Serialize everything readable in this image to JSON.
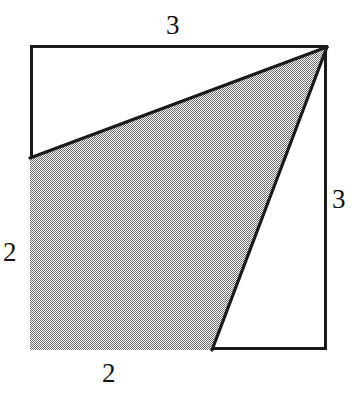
{
  "figure": {
    "kind": "geometry-diagram",
    "background_color": "#ffffff",
    "outline_color": "#1a1a1a",
    "fill_color": "#a9a9a9",
    "fill_pattern": "halftone-dither-50",
    "square": {
      "left": 30,
      "top": 45,
      "right": 327,
      "bottom": 350,
      "stroke_width": 3
    },
    "shaded_region": {
      "name": "shaded-quadrilateral",
      "points": "327,46 30,158 30,350 212,350",
      "vertices": [
        {
          "label": "top-right-corner",
          "x": 327,
          "y": 46
        },
        {
          "label": "left-edge-point",
          "x": 30,
          "y": 158
        },
        {
          "label": "bottom-left-corner",
          "x": 30,
          "y": 350
        },
        {
          "label": "bottom-edge-point",
          "x": 212,
          "y": 350
        }
      ]
    },
    "labels": {
      "top": "3",
      "right": "3",
      "left": "2",
      "bottom": "2"
    }
  }
}
